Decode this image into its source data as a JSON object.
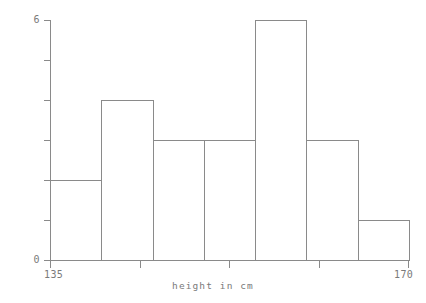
{
  "chart_data": {
    "type": "bar",
    "title": "",
    "subtitle": "",
    "xlabel": "height in cm",
    "ylabel": "",
    "categories": [
      "135-140",
      "140-145",
      "145-150",
      "150-155",
      "155-160",
      "160-165",
      "165-170"
    ],
    "bin_edges": [
      135,
      140,
      145,
      150,
      155,
      160,
      165,
      170
    ],
    "values": [
      2,
      4,
      3,
      3,
      6,
      3,
      1
    ],
    "total_count": 22,
    "xlim": [
      135,
      170
    ],
    "ylim": [
      0,
      6
    ],
    "x_tick_values": [
      135,
      143.75,
      152.5,
      161.25,
      170
    ],
    "x_tick_labels": [
      "135",
      "",
      "",
      "",
      "170"
    ],
    "y_tick_values": [
      0,
      1,
      2,
      3,
      4,
      5,
      6
    ],
    "y_tick_labels": [
      "0",
      "",
      "",
      "",
      "",
      "",
      "6"
    ],
    "grid": false,
    "legend": false,
    "legend_position": "none",
    "bar_fill": "none",
    "colors": {
      "bar_edge": "#8a8a8a",
      "axis": "#8a8a8a",
      "text": "#7a7a7a",
      "background": "#ffffff"
    }
  },
  "labels": {
    "y_max": "6",
    "y_min": "0",
    "x_min": "135",
    "x_max": "170",
    "x_axis_title": "height in cm"
  }
}
